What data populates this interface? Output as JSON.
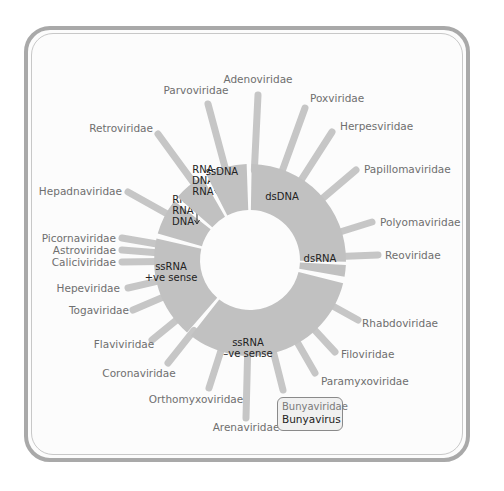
{
  "colors": {
    "ring": "#c1c1c1",
    "spike": "#c6c6c6",
    "frame": "#a9a9a9",
    "label": "#6f6f6f",
    "segment_text": "#222222"
  },
  "ring": {
    "cx": 250,
    "cy": 260,
    "r_inner": 50,
    "r_outer": 96
  },
  "segments": [
    {
      "id": "dsDNA",
      "label": [
        "dsDNA"
      ],
      "start": -89,
      "end": 1,
      "label_pos": [
        282,
        196
      ]
    },
    {
      "id": "dsRNA",
      "label": [
        "dsRNA"
      ],
      "start": 3,
      "end": 10,
      "label_pos": [
        320,
        258
      ]
    },
    {
      "id": "ssRNA-neg",
      "label": [
        "ssRNA",
        "–ve sense"
      ],
      "start": 14,
      "end": 128,
      "label_pos": [
        248,
        348
      ]
    },
    {
      "id": "ssRNA-pos",
      "label": [
        "ssRNA",
        "+ve sense"
      ],
      "start": 131,
      "end": 193,
      "label_pos": [
        171,
        272
      ]
    },
    {
      "id": "rt-rna-rna-dna",
      "label": [
        "RNA",
        "RNA",
        "DNA"
      ],
      "start": 196,
      "end": 218,
      "label_pos": [
        183,
        210
      ],
      "arrow": true
    },
    {
      "id": "rt-rna-dna-rna",
      "label": [
        "RNA",
        "DNA",
        "RNA"
      ],
      "start": 221,
      "end": 240,
      "label_pos": [
        203,
        180
      ],
      "arrow": true
    },
    {
      "id": "ssDNA",
      "label": [
        "ssDNA"
      ],
      "start": 243,
      "end": 268,
      "label_pos": [
        222,
        171
      ]
    }
  ],
  "families": [
    {
      "name": "Adenoviridae",
      "end": [
        258,
        95
      ],
      "label_pos": [
        258,
        83
      ],
      "anchor": "middle"
    },
    {
      "name": "Poxviridae",
      "end": [
        305,
        108
      ],
      "label_pos": [
        310,
        102
      ],
      "anchor": "start"
    },
    {
      "name": "Herpesviridae",
      "end": [
        332,
        132
      ],
      "label_pos": [
        340,
        130
      ],
      "anchor": "start"
    },
    {
      "name": "Papillomaviridae",
      "end": [
        356,
        170
      ],
      "label_pos": [
        364,
        173
      ],
      "anchor": "start"
    },
    {
      "name": "Polyomaviridae",
      "end": [
        372,
        222
      ],
      "label_pos": [
        380,
        226
      ],
      "anchor": "start"
    },
    {
      "name": "Reoviridae",
      "end": [
        378,
        255
      ],
      "label_pos": [
        385,
        259
      ],
      "anchor": "start"
    },
    {
      "name": "Rhabdoviridae",
      "end": [
        358,
        320
      ],
      "label_pos": [
        362,
        327
      ],
      "anchor": "start"
    },
    {
      "name": "Filoviridae",
      "end": [
        335,
        352
      ],
      "label_pos": [
        341,
        358
      ],
      "anchor": "start"
    },
    {
      "name": "Paramyxoviridae",
      "end": [
        315,
        373
      ],
      "label_pos": [
        321,
        385
      ],
      "anchor": "start"
    },
    {
      "name": "Bunyaviridae",
      "end": [
        283,
        390
      ],
      "label_pos": [
        0,
        0
      ],
      "anchor": "start",
      "boxed": true
    },
    {
      "name": "Arenaviridae",
      "end": [
        246,
        418
      ],
      "label_pos": [
        246,
        431
      ],
      "anchor": "middle"
    },
    {
      "name": "Orthomyxoviridae",
      "end": [
        209,
        388
      ],
      "label_pos": [
        196,
        403
      ],
      "anchor": "middle"
    },
    {
      "name": "Coronaviridae",
      "end": [
        168,
        363
      ],
      "label_pos": [
        139,
        377
      ],
      "anchor": "middle"
    },
    {
      "name": "Flaviviridae",
      "end": [
        152,
        340
      ],
      "label_pos": [
        124,
        348
      ],
      "anchor": "middle"
    },
    {
      "name": "Togaviridae",
      "end": [
        133,
        310
      ],
      "label_pos": [
        129,
        314
      ],
      "anchor": "end"
    },
    {
      "name": "Hepeviridae",
      "end": [
        128,
        288
      ],
      "label_pos": [
        120,
        292
      ],
      "anchor": "end"
    },
    {
      "name": "Caliciviridae",
      "end": [
        122,
        262
      ],
      "label_pos": [
        116,
        266
      ],
      "anchor": "end"
    },
    {
      "name": "Astroviridae",
      "end": [
        122,
        250
      ],
      "label_pos": [
        116,
        254
      ],
      "anchor": "end"
    },
    {
      "name": "Picornaviridae",
      "end": [
        122,
        238
      ],
      "label_pos": [
        116,
        242
      ],
      "anchor": "end"
    },
    {
      "name": "Hepadnaviridae",
      "end": [
        128,
        192
      ],
      "label_pos": [
        122,
        195
      ],
      "anchor": "end"
    },
    {
      "name": "Retroviridae",
      "end": [
        158,
        134
      ],
      "label_pos": [
        153,
        132
      ],
      "anchor": "end"
    },
    {
      "name": "Parvoviridae",
      "end": [
        208,
        104
      ],
      "label_pos": [
        196,
        94
      ],
      "anchor": "middle"
    }
  ],
  "highlight": {
    "family": "Bunyaviridae",
    "genus": "Bunyavirus",
    "box": {
      "left": 277,
      "top": 397,
      "width": 66,
      "height": 34
    }
  }
}
